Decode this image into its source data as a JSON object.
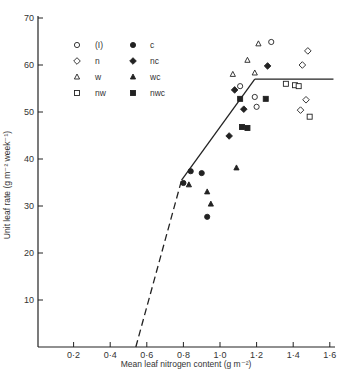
{
  "chart_data": {
    "type": "scatter",
    "title": "",
    "xlabel": "Mean leaf nitrogen content (g m⁻²)",
    "ylabel": "Unit leaf rate (g m⁻² week⁻¹)",
    "xlim": [
      0,
      1.6
    ],
    "ylim": [
      0,
      70
    ],
    "x_ticks": [
      "0·2",
      "0·4",
      "0·6",
      "0·8",
      "1·0",
      "1·2",
      "1·4",
      "1·6"
    ],
    "x_tick_values": [
      0.2,
      0.4,
      0.6,
      0.8,
      1.0,
      1.2,
      1.4,
      1.6
    ],
    "y_ticks": [
      "10",
      "20",
      "30",
      "40",
      "50",
      "60",
      "70"
    ],
    "y_tick_values": [
      10,
      20,
      30,
      40,
      50,
      60,
      70
    ],
    "grid": false,
    "legend_position": "upper-left-inside",
    "series": [
      {
        "name": "(I)",
        "marker": "open-circle",
        "points": [
          [
            1.28,
            64.9
          ],
          [
            1.11,
            55.5
          ],
          [
            1.19,
            53.2
          ],
          [
            1.2,
            51.1
          ]
        ]
      },
      {
        "name": "n",
        "marker": "open-diamond",
        "points": [
          [
            1.48,
            63.0
          ],
          [
            1.45,
            60.0
          ],
          [
            1.47,
            52.6
          ],
          [
            1.44,
            50.4
          ]
        ]
      },
      {
        "name": "w",
        "marker": "open-triangle",
        "points": [
          [
            1.21,
            64.5
          ],
          [
            1.15,
            61.0
          ],
          [
            1.07,
            58.0
          ],
          [
            1.19,
            58.3
          ]
        ]
      },
      {
        "name": "nw",
        "marker": "open-square",
        "points": [
          [
            1.36,
            56.0
          ],
          [
            1.41,
            55.7
          ],
          [
            1.43,
            55.5
          ],
          [
            1.49,
            49.0
          ]
        ]
      },
      {
        "name": "c",
        "marker": "filled-circle",
        "points": [
          [
            0.84,
            37.4
          ],
          [
            0.9,
            37.0
          ],
          [
            0.8,
            34.9
          ],
          [
            0.93,
            27.7
          ]
        ]
      },
      {
        "name": "nc",
        "marker": "filled-diamond",
        "points": [
          [
            1.26,
            59.8
          ],
          [
            1.08,
            54.7
          ],
          [
            1.13,
            50.6
          ],
          [
            1.05,
            44.9
          ]
        ]
      },
      {
        "name": "wc",
        "marker": "filled-triangle",
        "points": [
          [
            0.83,
            34.5
          ],
          [
            0.93,
            33.0
          ],
          [
            0.95,
            30.4
          ],
          [
            1.09,
            38.1
          ]
        ]
      },
      {
        "name": "nwc",
        "marker": "filled-square",
        "points": [
          [
            1.11,
            52.8
          ],
          [
            1.25,
            52.8
          ],
          [
            1.12,
            46.8
          ],
          [
            1.15,
            46.6
          ]
        ]
      }
    ],
    "fit_lines": [
      {
        "style": "dashed",
        "points": [
          [
            0.54,
            0
          ],
          [
            0.79,
            35.5
          ]
        ]
      },
      {
        "style": "solid",
        "points": [
          [
            0.79,
            35.5
          ],
          [
            1.19,
            57.0
          ]
        ]
      },
      {
        "style": "solid",
        "points": [
          [
            1.19,
            57.0
          ],
          [
            1.62,
            57.0
          ]
        ]
      }
    ]
  },
  "legend": {
    "items": [
      {
        "label": "(I)",
        "marker": "open-circle"
      },
      {
        "label": "n",
        "marker": "open-diamond"
      },
      {
        "label": "w",
        "marker": "open-triangle"
      },
      {
        "label": "nw",
        "marker": "open-square"
      },
      {
        "label": "c",
        "marker": "filled-circle"
      },
      {
        "label": "nc",
        "marker": "filled-diamond"
      },
      {
        "label": "wc",
        "marker": "filled-triangle"
      },
      {
        "label": "nwc",
        "marker": "filled-square"
      }
    ]
  },
  "colors": {
    "ink": "#222222",
    "background": "#ffffff"
  }
}
